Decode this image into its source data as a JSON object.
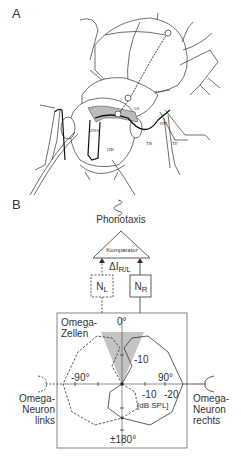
{
  "panelA": {
    "label": "A",
    "structures": [
      "AS",
      "HN",
      "TF",
      "TR",
      "ZNS",
      "HB"
    ]
  },
  "panelB": {
    "label": "B",
    "output": "Phonotaxis",
    "comparator": "Komparator",
    "delta_label": "ΔI",
    "delta_sub": "R/L",
    "neuron_left": {
      "main": "N",
      "sub": "L"
    },
    "neuron_right": {
      "main": "N",
      "sub": "R"
    },
    "box_title": "Omega-\nZellen",
    "box_title_line1": "Omega-",
    "box_title_line2": "Zellen",
    "angle_top": "0°",
    "angle_bottom": "±180°",
    "angle_left": "-90°",
    "angle_right": "90°",
    "ring_label_up": "-10",
    "ring_label_1": "-10",
    "ring_label_2": "-20",
    "unit": "[dB SPL]",
    "left_neuron": [
      "Omega-",
      "Neuron",
      "links"
    ],
    "right_neuron": [
      "Omega-",
      "Neuron",
      "rechts"
    ]
  },
  "colors": {
    "line": "#222222",
    "shade": "#bdbdbd",
    "box": "#555555"
  }
}
